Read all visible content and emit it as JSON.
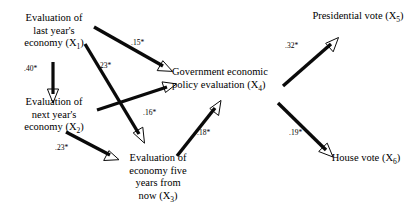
{
  "diagram": {
    "background_color": "#ffffff",
    "line_color": "#0a0a0a"
  },
  "nodes": [
    {
      "id": "x1",
      "name": "node-last-year-economy",
      "lines": [
        "Evaluation of",
        "last year's",
        "economy (X"
      ],
      "subscript": "1",
      "tail": ")"
    },
    {
      "id": "x2",
      "name": "node-next-year-economy",
      "lines": [
        "Evaluation of",
        "next year's",
        "economy (X"
      ],
      "subscript": "2",
      "tail": ")"
    },
    {
      "id": "x3",
      "name": "node-five-years-economy",
      "lines": [
        "Evaluation of",
        "economy five",
        "years from",
        "now (X"
      ],
      "subscript": "3",
      "tail": ")"
    },
    {
      "id": "x4",
      "name": "node-government-policy",
      "lines": [
        "Government economic",
        "policy evaluation (X"
      ],
      "subscript": "4",
      "tail": ")"
    },
    {
      "id": "x5",
      "name": "node-presidential-vote",
      "lines": [
        "Presidential vote (X"
      ],
      "subscript": "5",
      "tail": ")"
    },
    {
      "id": "x6",
      "name": "node-house-vote",
      "lines": [
        "House vote (X"
      ],
      "subscript": "6",
      "tail": ")"
    }
  ],
  "paths": [
    {
      "id": "p_x1_x2",
      "from": "x1",
      "to": "x2",
      "coefficient": ".40*"
    },
    {
      "id": "p_x1_x4",
      "from": "x1",
      "to": "x4",
      "coefficient": ".15*"
    },
    {
      "id": "p_x1_x3",
      "from": "x1",
      "to": "x3",
      "coefficient": ".23*"
    },
    {
      "id": "p_x2_x4",
      "from": "x2",
      "to": "x4",
      "coefficient": ".16*"
    },
    {
      "id": "p_x2_x3",
      "from": "x2",
      "to": "x3",
      "coefficient": ".23*"
    },
    {
      "id": "p_x3_x4",
      "from": "x3",
      "to": "x4",
      "coefficient": ".18*"
    },
    {
      "id": "p_x4_x5",
      "from": "x4",
      "to": "x5",
      "coefficient": ".32*"
    },
    {
      "id": "p_x4_x6",
      "from": "x4",
      "to": "x6",
      "coefficient": ".19*"
    }
  ]
}
